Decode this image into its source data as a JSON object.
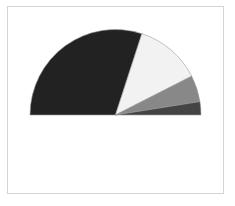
{
  "chart_data": {
    "type": "pie",
    "variant": "half-donut-semicircle",
    "title": "",
    "categories": [
      "Slice 1",
      "Slice 2",
      "Slice 3",
      "Slice 4"
    ],
    "values": [
      60,
      25,
      10,
      5
    ],
    "colors": [
      "#222222",
      "#f2f2f2",
      "#888888",
      "#444444"
    ],
    "start_angle_deg": 180,
    "end_angle_deg": 0,
    "legend": "none",
    "labels_shown": false,
    "outline_color": "#9a9a9a"
  },
  "layout": {
    "center_x": 115.5,
    "center_y": 115,
    "radius": 85.5
  }
}
